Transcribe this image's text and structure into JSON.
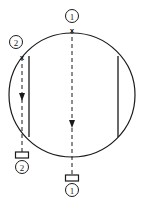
{
  "figure": {
    "background_color": "#ffffff",
    "line_color": "#1a1a1a",
    "width": 145,
    "height": 199
  },
  "outline": {
    "shape_name": "circle",
    "center_x": 72,
    "center_y": 95,
    "radius_x": 63,
    "radius_y": 62,
    "stroke_width": 1.2
  },
  "chords": [
    {
      "name": "left-chord",
      "x": 29,
      "y_top": 56,
      "y_bottom": 137,
      "stroke_width": 1.3
    },
    {
      "name": "right-chord",
      "x": 118,
      "y_top": 56,
      "y_bottom": 137,
      "stroke_width": 1.3
    }
  ],
  "cutting_planes": [
    {
      "id": "plane-2",
      "label": "②",
      "label_top": "②",
      "label_bottom": "②",
      "x": 22,
      "y_top": 57,
      "y_bottom": 152,
      "arrow_y": 97,
      "xmark": "x",
      "xmark_y": 57,
      "top_label_x": 16,
      "top_label_y": 42,
      "bottom_label_x": 22,
      "bottom_label_y": 168,
      "flag_x": 22,
      "flag_y": 155,
      "flag_width": 13,
      "flag_height": 6
    },
    {
      "id": "plane-1",
      "label": "①",
      "label_top": "①",
      "label_bottom": "①",
      "x": 72,
      "y_top": 28,
      "y_bottom": 178,
      "arrow_y": 124,
      "xmark": "x",
      "xmark_y": 30,
      "top_label_x": 72,
      "top_label_y": 16,
      "bottom_label_x": 72,
      "bottom_label_y": 188,
      "flag_x": 72,
      "flag_y": 176,
      "flag_width": 13,
      "flag_height": 6
    }
  ],
  "dash_pattern": "4,3",
  "arrow_size": 4
}
